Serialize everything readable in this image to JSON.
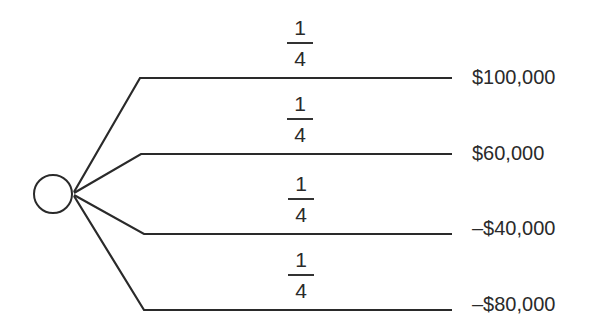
{
  "diagram": {
    "type": "probability-tree",
    "chance_node": {
      "shape": "circle",
      "cx": 53,
      "cy": 194,
      "r": 19
    },
    "line_color": "#2a2a2a",
    "branches": [
      {
        "probability": {
          "numerator": "1",
          "denominator": "4"
        },
        "payoff": "$100,000",
        "y": 78
      },
      {
        "probability": {
          "numerator": "1",
          "denominator": "4"
        },
        "payoff": "$60,000",
        "y": 154
      },
      {
        "probability": {
          "numerator": "1",
          "denominator": "4"
        },
        "payoff": "–$40,000",
        "y": 234
      },
      {
        "probability": {
          "numerator": "1",
          "denominator": "4"
        },
        "payoff": "–$80,000",
        "y": 310
      }
    ]
  }
}
